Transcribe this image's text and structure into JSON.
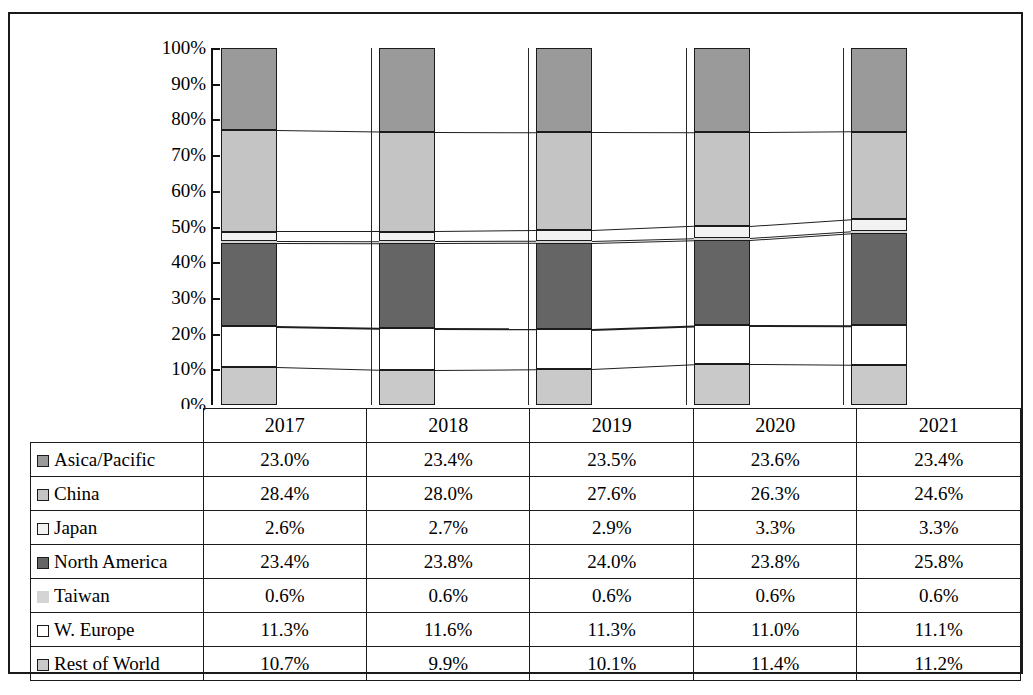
{
  "chart_data": {
    "type": "bar",
    "subtype": "100% stacked column with data table",
    "title": "",
    "xlabel": "",
    "ylabel": "",
    "categories": [
      "2017",
      "2018",
      "2019",
      "2020",
      "2021"
    ],
    "ylim": [
      0,
      100
    ],
    "ytick_labels": [
      "0%",
      "10%",
      "20%",
      "30%",
      "40%",
      "50%",
      "60%",
      "70%",
      "80%",
      "90%",
      "100%"
    ],
    "ytick_values": [
      0,
      10,
      20,
      30,
      40,
      50,
      60,
      70,
      80,
      90,
      100
    ],
    "grid": false,
    "legend_position": "data-table-row-headers",
    "stack_order_bottom_to_top": [
      "Rest of World",
      "W. Europe",
      "North America",
      "Taiwan",
      "Japan",
      "China",
      "Asica/Pacific"
    ],
    "series": [
      {
        "name": "Asica/Pacific",
        "swatch_color": "#9a9a9a",
        "swatch_border": "#1b1b1b",
        "values": [
          23.0,
          23.4,
          23.5,
          23.6,
          23.4
        ],
        "labels": [
          "23.0%",
          "23.4%",
          "23.5%",
          "23.6%",
          "23.4%"
        ]
      },
      {
        "name": "China",
        "swatch_color": "#c4c4c4",
        "swatch_border": "#1b1b1b",
        "values": [
          28.4,
          28.0,
          27.6,
          26.3,
          24.6
        ],
        "labels": [
          "28.4%",
          "28.0%",
          "27.6%",
          "26.3%",
          "24.6%"
        ]
      },
      {
        "name": "Japan",
        "swatch_color": "#f2f2f2",
        "swatch_border": "#1b1b1b",
        "values": [
          2.6,
          2.7,
          2.9,
          3.3,
          3.3
        ],
        "labels": [
          "2.6%",
          "2.7%",
          "2.9%",
          "3.3%",
          "3.3%"
        ]
      },
      {
        "name": "North America",
        "swatch_color": "#656565",
        "swatch_border": "#1b1b1b",
        "values": [
          23.4,
          23.8,
          24.0,
          23.8,
          25.8
        ],
        "labels": [
          "23.4%",
          "23.8%",
          "24.0%",
          "23.8%",
          "25.8%"
        ]
      },
      {
        "name": "Taiwan",
        "swatch_color": "#d4d4d4",
        "swatch_border": "#d4d4d4",
        "values": [
          0.6,
          0.6,
          0.6,
          0.6,
          0.6
        ],
        "labels": [
          "0.6%",
          "0.6%",
          "0.6%",
          "0.6%",
          "0.6%"
        ]
      },
      {
        "name": "W. Europe",
        "swatch_color": "#ffffff",
        "swatch_border": "#1b1b1b",
        "values": [
          11.3,
          11.6,
          11.3,
          11.0,
          11.1
        ],
        "labels": [
          "11.3%",
          "11.6%",
          "11.3%",
          "11.0%",
          "11.1%"
        ]
      },
      {
        "name": "Rest of World",
        "swatch_color": "#c9c9c9",
        "swatch_border": "#1b1b1b",
        "values": [
          10.7,
          9.9,
          10.1,
          11.4,
          11.2
        ],
        "labels": [
          "10.7%",
          "9.9%",
          "10.1%",
          "11.4%",
          "11.2%"
        ]
      }
    ]
  },
  "table": {
    "corner_label": "",
    "column_headers": [
      "2017",
      "2018",
      "2019",
      "2020",
      "2021"
    ]
  }
}
